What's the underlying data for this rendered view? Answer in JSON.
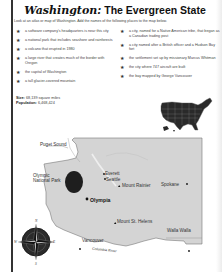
{
  "header": {
    "title_script": "Washington:",
    "title_rest": " The Evergreen State",
    "instructions": "Look at an atlas or map of Washington. Add the names of the following places to the map below."
  },
  "clues": {
    "left": [
      "a software company's headquarters is near this city",
      "a national park that includes seashore and rainforests",
      "a volcano that erupted in 1980",
      "a large river that creates much of the border with Oregon",
      "the capital of Washington",
      "a tall glacier-covered mountain"
    ],
    "right": [
      "a city, named for a Native American tribe, that began as a Canadian trading post",
      "a city named after a British officer and a Hudson Bay fort",
      "the settlement set up by missionary Marcus Whitman",
      "the city where 747 aircraft are built",
      "the bay mapped by George Vancouver"
    ]
  },
  "facts": {
    "size_label": "Size:",
    "size_value": " 68,139 square miles",
    "population_label": "Population:",
    "population_value": " 6,468,424"
  },
  "map": {
    "labels": {
      "puget_sound": "Puget Sound",
      "olympic_np_line1": "Olympic",
      "olympic_np_line2": "National Park",
      "everett": "Everett",
      "seattle": "Seattle",
      "mount_rainier": "Mount Rainier",
      "olympia": "Olympia",
      "spokane": "Spokane",
      "mount_st_helens": "Mount St. Helens",
      "walla_walla": "Walla Walla",
      "vancouver": "Vancouver",
      "columbia_river": "Columbia River"
    },
    "colors": {
      "land": "#d4d4d4",
      "park": "#1e1e1e",
      "outline": "#777777"
    }
  },
  "compass": {
    "n": "N",
    "e": "E",
    "s": "S",
    "w": "W"
  }
}
